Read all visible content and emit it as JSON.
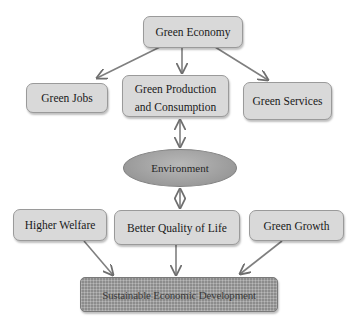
{
  "diagram": {
    "nodes": {
      "green_economy": "Green Economy",
      "green_jobs": "Green Jobs",
      "green_production_line1": "Green Production",
      "green_production_line2": "and Consumption",
      "green_services": "Green Services",
      "environment": "Environment",
      "higher_welfare": "Higher Welfare",
      "better_quality_of_life": "Better Quality of Life",
      "green_growth": "Green Growth",
      "sustainable_development": "Sustainable Economic Development"
    },
    "edges": [
      {
        "from": "Green Economy",
        "to": "Green Jobs",
        "type": "arrow"
      },
      {
        "from": "Green Economy",
        "to": "Green Production and Consumption",
        "type": "arrow"
      },
      {
        "from": "Green Economy",
        "to": "Green Services",
        "type": "arrow"
      },
      {
        "from": "Green Production and Consumption",
        "to": "Environment",
        "type": "bidirectional"
      },
      {
        "from": "Environment",
        "to": "Better Quality of Life",
        "type": "bidirectional"
      },
      {
        "from": "Higher Welfare",
        "to": "Sustainable Economic Development",
        "type": "arrow"
      },
      {
        "from": "Better Quality of Life",
        "to": "Sustainable Economic Development",
        "type": "arrow"
      },
      {
        "from": "Green Growth",
        "to": "Sustainable Economic Development",
        "type": "arrow"
      }
    ],
    "colors": {
      "box_fill": "#d9d9d9",
      "box_border": "#9a9a9a",
      "edge": "#7a7a7a",
      "ellipse_fill": "#9a9a9a",
      "bottom_box_fill": "#8c8c8c"
    }
  }
}
